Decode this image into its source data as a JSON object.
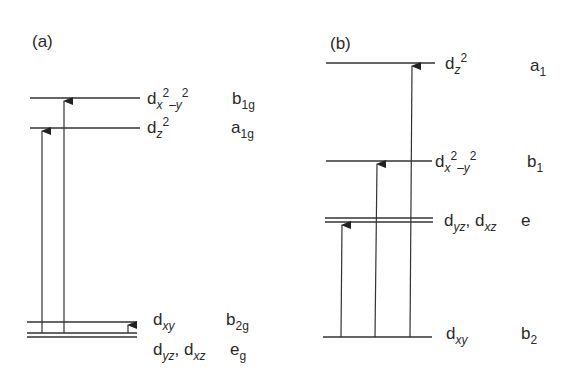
{
  "panels": {
    "a": {
      "label": "(a)",
      "levels": [
        {
          "orbital": "d",
          "orbital_sub": "x",
          "orbital_sup": "2",
          "orbital_tail_sub": "–y",
          "orbital_tail_sup": "2",
          "symmetry": "b",
          "symmetry_sub": "1g"
        },
        {
          "orbital": "d",
          "orbital_sub": "z",
          "orbital_sup": "2",
          "symmetry": "a",
          "symmetry_sub": "1g"
        },
        {
          "orbital": "d",
          "orbital_sub": "xy",
          "symmetry": "b",
          "symmetry_sub": "2g"
        },
        {
          "orbital": "d",
          "orbital_sub": "yz",
          "orbital2": ", d",
          "orbital2_sub": "xz",
          "symmetry": "e",
          "symmetry_sub": "g"
        }
      ],
      "transitions": [
        "e_g → a_1g",
        "e_g → b_1g",
        "e_g → b_2g"
      ]
    },
    "b": {
      "label": "(b)",
      "levels": [
        {
          "orbital": "d",
          "orbital_sub": "z",
          "orbital_sup": "2",
          "symmetry": "a",
          "symmetry_sub": "1"
        },
        {
          "orbital": "d",
          "orbital_sub": "x",
          "orbital_sup": "2",
          "orbital_tail_sub": "–y",
          "orbital_tail_sup": "2",
          "symmetry": "b",
          "symmetry_sub": "1"
        },
        {
          "orbital": "d",
          "orbital_sub": "yz",
          "orbital2": ", d",
          "orbital2_sub": "xz",
          "symmetry": "e",
          "symmetry_sub": ""
        },
        {
          "orbital": "d",
          "orbital_sub": "xy",
          "symmetry": "b",
          "symmetry_sub": "2"
        }
      ],
      "transitions": [
        "b_2 → e",
        "b_2 → b_1",
        "b_2 → a_1"
      ]
    }
  }
}
